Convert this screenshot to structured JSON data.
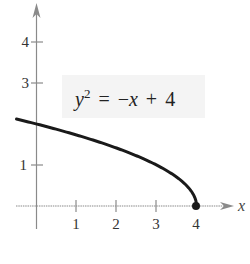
{
  "chart_data": {
    "type": "line",
    "title": "",
    "equation": {
      "lhs_var": "y",
      "lhs_exp": "2",
      "rhs": "= −x + 4",
      "parts": [
        "y",
        "2",
        "=",
        "−",
        "x",
        "+",
        "4"
      ]
    },
    "xlabel": "x",
    "ylabel": "",
    "xlim": [
      -0.5,
      5
    ],
    "ylim": [
      -0.5,
      5
    ],
    "x_ticks": [
      1,
      2,
      3,
      4
    ],
    "x_tick_labels": [
      "1",
      "2",
      "3",
      "4"
    ],
    "y_ticks": [
      1,
      3,
      4
    ],
    "y_tick_labels": [
      "1",
      "3",
      "4"
    ],
    "grid": false,
    "legend": null,
    "series": [
      {
        "name": "y = sqrt(-x + 4)",
        "x": [
          -0.5,
          0,
          0.5,
          1,
          1.5,
          2,
          2.5,
          3,
          3.5,
          3.75,
          3.9,
          4
        ],
        "y": [
          2.12,
          2.0,
          1.87,
          1.73,
          1.58,
          1.41,
          1.22,
          1.0,
          0.71,
          0.5,
          0.32,
          0
        ],
        "endpoint": {
          "x": 4,
          "y": 0,
          "marker": "filled-circle"
        }
      }
    ],
    "colors": {
      "curve": "#1a1a1a",
      "axis": "#8a8a8a",
      "label_box": "#f4f4f4",
      "text": "#333333"
    }
  }
}
